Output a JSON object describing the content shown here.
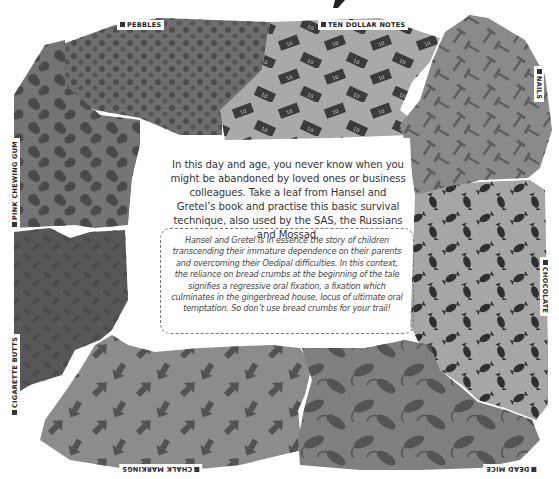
{
  "illustration": {
    "zones": [
      {
        "id": "pebbles",
        "label": "PEBBLES",
        "icon": "pebble-icon",
        "fill": "#6e6e6e",
        "motif": "#4c4c4c"
      },
      {
        "id": "ten-dollar-notes",
        "label": "TEN DOLLAR NOTES",
        "icon": "banknote-icon",
        "fill": "#a9a9a9",
        "motif": "#3b3b3b"
      },
      {
        "id": "nails",
        "label": "NAILS",
        "icon": "nail-icon",
        "fill": "#8a8a8a",
        "motif": "#5e5e5e"
      },
      {
        "id": "chocolate",
        "label": "CHOCOLATE",
        "icon": "wrapped-sweet-icon",
        "fill": "#a6a6a6",
        "motif": "#2f2f2f"
      },
      {
        "id": "dead-mice",
        "label": "DEAD MICE",
        "icon": "mouse-icon",
        "fill": "#7f7f7f",
        "motif": "#545454"
      },
      {
        "id": "chalk-markings",
        "label": "CHALK MARKINGS",
        "icon": "arrow-icon",
        "fill": "#8c8c8c",
        "motif": "#525252"
      },
      {
        "id": "cigarette-butts",
        "label": "CIGARETTE BUTTS",
        "icon": "cigarette-butt-icon",
        "fill": "#575757",
        "motif": "#4a4a4a"
      },
      {
        "id": "pink-chewing-gum",
        "label": "PINK CHEWING GUM",
        "icon": "gum-blob-icon",
        "fill": "#747474",
        "motif": "#4d4d4d"
      }
    ],
    "banknote_text": "10"
  },
  "intro_text": "In this day and age, you never know when you might be abandoned by loved ones or business colleagues. Take a leaf from Hansel and Gretel’s book and practise this basic survival technique, also used by the SAS, the Russians and Mossad.",
  "aside_text": "Hansel and Gretel is in essence the story of children transcending their immature dependence on their parents and overcoming their Oedipal difficulties. In this context, the reliance on bread crumbs at the beginning of the tale signifies a regressive oral fixation, a fixation which culminates in the gingerbread house, locus of ultimate oral temptation. So don’t use bread crumbs for your trail!"
}
